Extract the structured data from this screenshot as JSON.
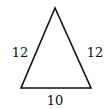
{
  "diagram": {
    "shape": "isosceles-triangle",
    "vertices": {
      "apex": [
        55,
        8
      ],
      "base_left": [
        21,
        88
      ],
      "base_right": [
        91,
        88
      ]
    },
    "labels": {
      "left_side": "12",
      "right_side": "12",
      "base": "10"
    },
    "stroke_color": "#111111"
  }
}
